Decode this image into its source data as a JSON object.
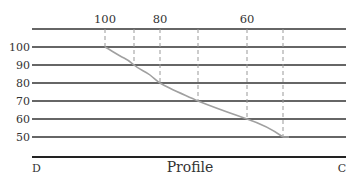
{
  "diagram": {
    "title": "Profile",
    "left_end_label": "D",
    "right_end_label": "C",
    "top_contour_labels": [
      {
        "text": "100",
        "x": 105
      },
      {
        "text": "80",
        "x": 160
      },
      {
        "text": "60",
        "x": 247
      }
    ],
    "elevation_levels": [
      {
        "text": "100",
        "y": 47
      },
      {
        "text": "90",
        "y": 65
      },
      {
        "text": "80",
        "y": 83
      },
      {
        "text": "70",
        "y": 101
      },
      {
        "text": "60",
        "y": 119
      },
      {
        "text": "50",
        "y": 137
      }
    ],
    "projection_x": [
      105,
      134,
      160,
      198,
      247,
      283
    ],
    "profile_points": [
      {
        "x": 105,
        "elevation": 100
      },
      {
        "x": 134,
        "elevation": 90
      },
      {
        "x": 160,
        "elevation": 80
      },
      {
        "x": 198,
        "elevation": 70
      },
      {
        "x": 247,
        "elevation": 60
      },
      {
        "x": 283,
        "elevation": 50
      }
    ],
    "colors": {
      "line": "#333333",
      "profile": "#a0a0a0",
      "dash": "#999999"
    }
  }
}
